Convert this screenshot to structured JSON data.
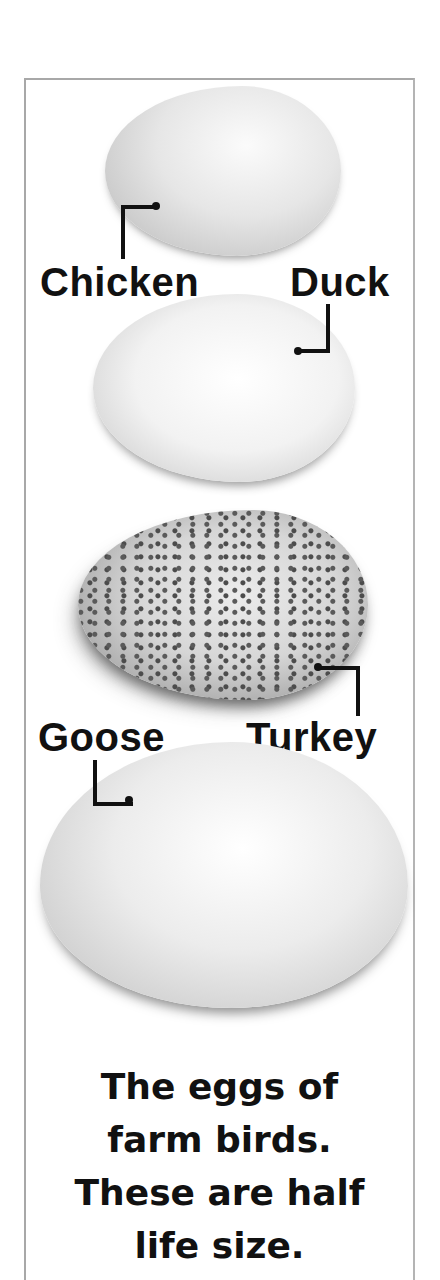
{
  "figure": {
    "eggs": [
      {
        "name": "Chicken",
        "label": "Chicken",
        "pattern": "plain"
      },
      {
        "name": "Duck",
        "label": "Duck",
        "pattern": "plain"
      },
      {
        "name": "Turkey",
        "label": "Turkey",
        "pattern": "speckled"
      },
      {
        "name": "Goose",
        "label": "Goose",
        "pattern": "plain"
      }
    ],
    "caption_lines": [
      "The eggs of",
      "farm birds.",
      "These are half",
      "life size."
    ],
    "colors": {
      "text": "#111111",
      "frame": "#a8a8a8",
      "background": "#ffffff"
    }
  }
}
